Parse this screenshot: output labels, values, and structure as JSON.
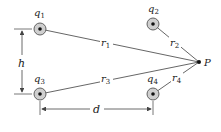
{
  "diagram": {
    "colors": {
      "line": "#555555",
      "charge_fill": "#cfcfcf",
      "charge_ring": "#555555",
      "dot": "#111111",
      "text": "#222222"
    },
    "charges": [
      {
        "id": "q1",
        "label": "q",
        "sub": "1",
        "x": 40,
        "y": 29
      },
      {
        "id": "q2",
        "label": "q",
        "sub": "2",
        "x": 153,
        "y": 24
      },
      {
        "id": "q3",
        "label": "q",
        "sub": "3",
        "x": 40,
        "y": 94
      },
      {
        "id": "q4",
        "label": "q",
        "sub": "4",
        "x": 153,
        "y": 94
      }
    ],
    "point": {
      "label": "P",
      "x": 199,
      "y": 62
    },
    "distances": [
      {
        "id": "r1",
        "label": "r",
        "sub": "1"
      },
      {
        "id": "r2",
        "label": "r",
        "sub": "2"
      },
      {
        "id": "r3",
        "label": "r",
        "sub": "3"
      },
      {
        "id": "r4",
        "label": "r",
        "sub": "4"
      }
    ],
    "dimensions": {
      "h": {
        "label": "h"
      },
      "d": {
        "label": "d"
      }
    }
  }
}
